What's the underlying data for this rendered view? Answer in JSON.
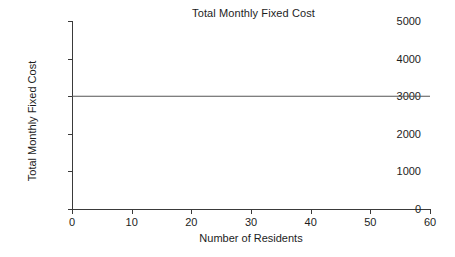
{
  "chart_data": {
    "type": "line",
    "title": "Total Monthly Fixed Cost",
    "xlabel": "Number of Residents",
    "ylabel": "Total Monthly Fixed Cost",
    "xlim": [
      0,
      60
    ],
    "ylim": [
      0,
      5000
    ],
    "grid": false,
    "legend": null,
    "x_ticks": [
      0,
      10,
      20,
      30,
      40,
      50,
      60
    ],
    "x_tick_labels": [
      "0",
      "10",
      "20",
      "30",
      "40",
      "50",
      "60"
    ],
    "y_ticks": [
      0,
      1000,
      2000,
      3000,
      4000,
      5000
    ],
    "y_tick_labels": [
      "0",
      "1000",
      "2000",
      "3000",
      "4000",
      "5000"
    ],
    "series": [
      {
        "name": "Total Monthly Fixed Cost",
        "color": "#555555",
        "x": [
          0,
          10,
          20,
          30,
          40,
          50,
          60
        ],
        "values": [
          3000,
          3000,
          3000,
          3000,
          3000,
          3000,
          3000
        ]
      }
    ],
    "annotations": []
  }
}
